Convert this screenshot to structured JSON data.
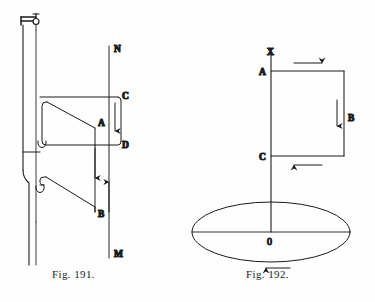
{
  "document": {
    "kind": "book-illustration-plate",
    "background_color": "#fefefe",
    "ink_color": "#1a1a1a"
  },
  "figures": [
    {
      "id": "fig-191",
      "caption": "Fig. 191.",
      "description": "Apparatus with suspended vertical rod, two wire loops and a vertical magnet line NM showing current directions",
      "labels": [
        {
          "name": "N",
          "text": "N",
          "x": 114,
          "y": 52
        },
        {
          "name": "C",
          "text": "C",
          "x": 122,
          "y": 96
        },
        {
          "name": "A",
          "text": "A",
          "x": 98,
          "y": 123
        },
        {
          "name": "D",
          "text": "D",
          "x": 122,
          "y": 145
        },
        {
          "name": "B",
          "text": "B",
          "x": 98,
          "y": 214
        },
        {
          "name": "M",
          "text": "M",
          "x": 114,
          "y": 254
        }
      ],
      "arrows": [
        {
          "name": "arrow-cd-down",
          "direction": "down"
        },
        {
          "name": "arrow-a-down",
          "direction": "down"
        },
        {
          "name": "arrow-b-up",
          "direction": "up"
        }
      ]
    },
    {
      "id": "fig-192",
      "caption": "Fig. 192.",
      "description": "Vertical axis XO with rectangular circuit ABC and horizontal disc ellipse rotating about O",
      "labels": [
        {
          "name": "X",
          "text": "X",
          "x": 272,
          "y": 52
        },
        {
          "name": "A",
          "text": "A",
          "x": 261,
          "y": 76
        },
        {
          "name": "B",
          "text": "B",
          "x": 348,
          "y": 118
        },
        {
          "name": "C",
          "text": "C",
          "x": 261,
          "y": 160
        },
        {
          "name": "O",
          "text": "0",
          "x": 268,
          "y": 244
        }
      ],
      "arrows": [
        {
          "name": "arrow-top-right",
          "direction": "right"
        },
        {
          "name": "arrow-right-down",
          "direction": "down"
        },
        {
          "name": "arrow-bottom-left",
          "direction": "left"
        },
        {
          "name": "arrow-disc-left",
          "direction": "left"
        }
      ]
    }
  ]
}
